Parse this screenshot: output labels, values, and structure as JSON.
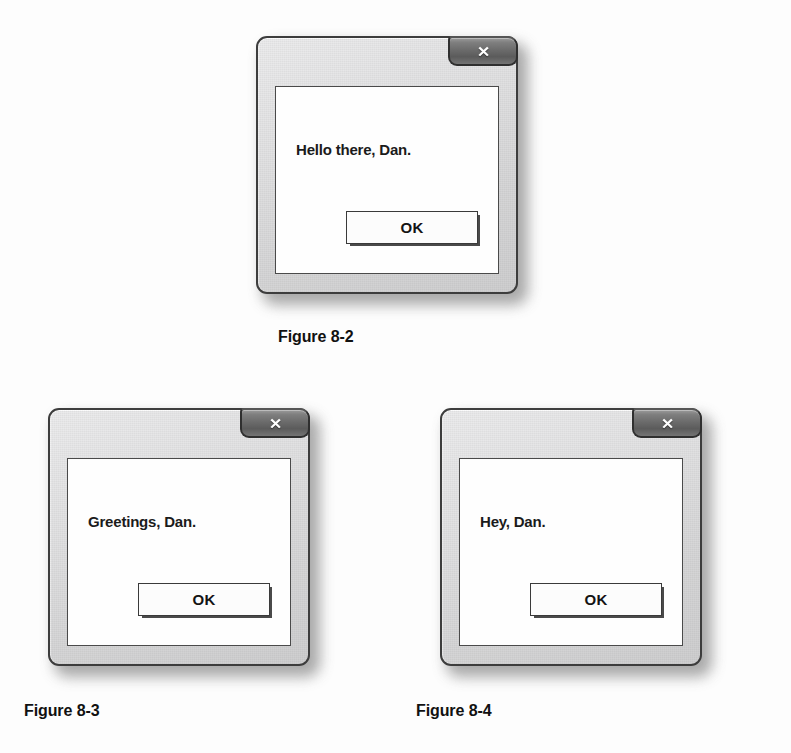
{
  "page": {
    "background_color": "#fdfdfd",
    "text_color": "#111111"
  },
  "figures": [
    {
      "id": "figure-8-2",
      "caption": "Figure 8-2",
      "dialog": {
        "message": "Hello there, Dan.",
        "close_button_glyph": "✕",
        "close_button_name": "close",
        "ok_button_label": "OK",
        "chrome_color": "#d9d9da",
        "client_color": "#fefefe",
        "border_color": "#3d3d3d",
        "close_button_color": "#6a6a6a"
      }
    },
    {
      "id": "figure-8-3",
      "caption": "Figure 8-3",
      "dialog": {
        "message": "Greetings, Dan.",
        "close_button_glyph": "✕",
        "close_button_name": "close",
        "ok_button_label": "OK",
        "chrome_color": "#d9d9da",
        "client_color": "#fefefe",
        "border_color": "#3d3d3d",
        "close_button_color": "#6a6a6a"
      }
    },
    {
      "id": "figure-8-4",
      "caption": "Figure 8-4",
      "dialog": {
        "message": "Hey, Dan.",
        "close_button_glyph": "✕",
        "close_button_name": "close",
        "ok_button_label": "OK",
        "chrome_color": "#d9d9da",
        "client_color": "#fefefe",
        "border_color": "#3d3d3d",
        "close_button_color": "#6a6a6a"
      }
    }
  ]
}
